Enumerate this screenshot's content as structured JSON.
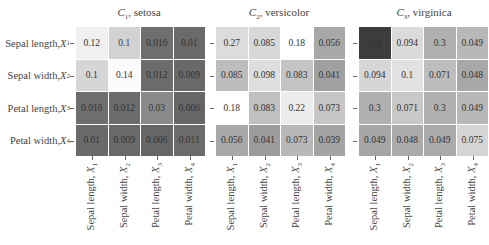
{
  "chart_data": {
    "type": "heatmap",
    "features": [
      "Sepal length, X1",
      "Sepal width, X2",
      "Petal length, X3",
      "Petal width, X4"
    ],
    "row_labels": [
      "Sepal length, X1",
      "Sepal width, X2",
      "Petal length, X3",
      "Petal width, X4"
    ],
    "col_labels": [
      "Sepal length, X1",
      "Sepal width, X2",
      "Petal length, X3",
      "Petal width, X4"
    ],
    "colormap": "grayscale (higher relative value = lighter, except virginica top-left darkest)",
    "panels": [
      {
        "title": "C1, setosa",
        "matrix": [
          [
            0.12,
            0.1,
            0.016,
            0.01
          ],
          [
            0.1,
            0.14,
            0.012,
            0.009
          ],
          [
            0.016,
            0.012,
            0.03,
            0.006
          ],
          [
            0.01,
            0.009,
            0.006,
            0.011
          ]
        ]
      },
      {
        "title": "C2, versicolor",
        "matrix": [
          [
            0.27,
            0.085,
            0.18,
            0.056
          ],
          [
            0.085,
            0.098,
            0.083,
            0.041
          ],
          [
            0.18,
            0.083,
            0.22,
            0.073
          ],
          [
            0.056,
            0.041,
            0.073,
            0.039
          ]
        ]
      },
      {
        "title": "C3, virginica",
        "matrix": [
          [
            0.4,
            0.094,
            0.3,
            0.049
          ],
          [
            0.094,
            0.1,
            0.071,
            0.048
          ],
          [
            0.3,
            0.071,
            0.3,
            0.049
          ],
          [
            0.049,
            0.048,
            0.049,
            0.075
          ]
        ]
      }
    ],
    "grid": false,
    "legend": "none"
  },
  "panels": [
    {
      "title_symbol": "C",
      "title_sub": "1",
      "title_name": ", setosa",
      "cells": [
        {
          "v": "0.12",
          "c": "#f0f0f0"
        },
        {
          "v": "0.1",
          "c": "#d2d2d2"
        },
        {
          "v": "0.016",
          "c": "#6e6e6e"
        },
        {
          "v": "0.01",
          "c": "#6a6a6a"
        },
        {
          "v": "0.1",
          "c": "#d6d6d6"
        },
        {
          "v": "0.14",
          "c": "#fbfbfb"
        },
        {
          "v": "0.012",
          "c": "#6c6c6c"
        },
        {
          "v": "0.009",
          "c": "#696969"
        },
        {
          "v": "0.016",
          "c": "#6e6e6e"
        },
        {
          "v": "0.012",
          "c": "#6c6c6c"
        },
        {
          "v": "0.03",
          "c": "#8a8a8a"
        },
        {
          "v": "0.006",
          "c": "#666666"
        },
        {
          "v": "0.01",
          "c": "#6a6a6a"
        },
        {
          "v": "0.009",
          "c": "#696969"
        },
        {
          "v": "0.006",
          "c": "#666666"
        },
        {
          "v": "0.011",
          "c": "#6b6b6b"
        }
      ]
    },
    {
      "title_symbol": "C",
      "title_sub": "2",
      "title_name": ", versicolor",
      "cells": [
        {
          "v": "0.27",
          "c": "#dcdcdc"
        },
        {
          "v": "0.085",
          "c": "#d8d8d8"
        },
        {
          "v": "0.18",
          "c": "#ffffff"
        },
        {
          "v": "0.056",
          "c": "#a8a8a8"
        },
        {
          "v": "0.085",
          "c": "#bdbdbd"
        },
        {
          "v": "0.098",
          "c": "#dedede"
        },
        {
          "v": "0.083",
          "c": "#c4c4c4"
        },
        {
          "v": "0.041",
          "c": "#a0a0a0"
        },
        {
          "v": "0.18",
          "c": "#ffffff"
        },
        {
          "v": "0.083",
          "c": "#c0c0c0"
        },
        {
          "v": "0.22",
          "c": "#ececec"
        },
        {
          "v": "0.073",
          "c": "#c6c6c6"
        },
        {
          "v": "0.056",
          "c": "#a8a8a8"
        },
        {
          "v": "0.041",
          "c": "#9c9c9c"
        },
        {
          "v": "0.073",
          "c": "#b8b8b8"
        },
        {
          "v": "0.039",
          "c": "#a4a4a4"
        }
      ]
    },
    {
      "title_symbol": "C",
      "title_sub": "3",
      "title_name": ", virginica",
      "cells": [
        {
          "v": "0.4",
          "c": "#3c3c3c"
        },
        {
          "v": "0.094",
          "c": "#dadada"
        },
        {
          "v": "0.3",
          "c": "#b0b0b0"
        },
        {
          "v": "0.049",
          "c": "#b8b8b8"
        },
        {
          "v": "0.094",
          "c": "#d6d6d6"
        },
        {
          "v": "0.1",
          "c": "#e2e2e2"
        },
        {
          "v": "0.071",
          "c": "#bdbdbd"
        },
        {
          "v": "0.048",
          "c": "#a8a8a8"
        },
        {
          "v": "0.3",
          "c": "#b0b0b0"
        },
        {
          "v": "0.071",
          "c": "#c8c8c8"
        },
        {
          "v": "0.3",
          "c": "#b0b0b0"
        },
        {
          "v": "0.049",
          "c": "#b8b8b8"
        },
        {
          "v": "0.049",
          "c": "#a6a6a6"
        },
        {
          "v": "0.048",
          "c": "#ababab"
        },
        {
          "v": "0.049",
          "c": "#aaaaaa"
        },
        {
          "v": "0.075",
          "c": "#d4d4d4"
        }
      ]
    }
  ],
  "axis": {
    "rows": [
      {
        "name": "Sepal length, ",
        "sym": "X",
        "sub": "1"
      },
      {
        "name": "Sepal width, ",
        "sym": "X",
        "sub": "2"
      },
      {
        "name": "Petal length, ",
        "sym": "X",
        "sub": "3"
      },
      {
        "name": "Petal width, ",
        "sym": "X",
        "sub": "4"
      }
    ],
    "cols": [
      {
        "name": "Sepal length, ",
        "sym": "X",
        "sub": "1"
      },
      {
        "name": "Sepal width, ",
        "sym": "X",
        "sub": "2"
      },
      {
        "name": "Petal length, ",
        "sym": "X",
        "sub": "3"
      },
      {
        "name": "Petal width, ",
        "sym": "X",
        "sub": "4"
      }
    ]
  }
}
